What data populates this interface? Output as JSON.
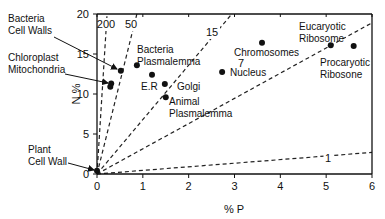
{
  "chart_data": {
    "type": "scatter",
    "title": "",
    "xlabel": "% P",
    "ylabel": "% N",
    "xlim": [
      0,
      6
    ],
    "ylim": [
      0,
      20
    ],
    "xticks": [
      "0",
      "1",
      "2",
      "3",
      "4",
      "5",
      "6"
    ],
    "yticks": [
      "0",
      "5",
      "10",
      "15",
      "20"
    ],
    "grid": false,
    "ratio_lines": [
      {
        "label": "200",
        "ratio": 200
      },
      {
        "label": "50",
        "ratio": 50
      },
      {
        "label": "15",
        "ratio": 15
      },
      {
        "label": "7",
        "ratio": 7
      },
      {
        "label": "1",
        "ratio": 1
      }
    ],
    "points": [
      {
        "name": "Chloroplast",
        "x": 0.31,
        "y": 11.3
      },
      {
        "name": "Mitochondria",
        "x": 0.29,
        "y": 10.9
      },
      {
        "name": "Bacteria Cell Walls",
        "x": 0.52,
        "y": 12.9
      },
      {
        "name": "Bacteria Plasmalemma",
        "x": 0.87,
        "y": 13.6
      },
      {
        "name": "E.R",
        "x": 1.2,
        "y": 12.4
      },
      {
        "name": "Golgi",
        "x": 1.48,
        "y": 11.25
      },
      {
        "name": "Animal Plasmalemma",
        "x": 1.5,
        "y": 9.6
      },
      {
        "name": "Nucleus",
        "x": 2.73,
        "y": 12.75
      },
      {
        "name": "Chromosomes",
        "x": 3.6,
        "y": 16.4
      },
      {
        "name": "Eucaryotic Ribosome",
        "x": 5.1,
        "y": 16.1
      },
      {
        "name": "Procaryotic Ribosone",
        "x": 5.6,
        "y": 16.0
      },
      {
        "name": "Plant Cell Wall",
        "x": 0.0,
        "y": 0.4
      }
    ],
    "annotations": [
      {
        "text": [
          "Bacteria",
          "Cell Walls"
        ],
        "target": "Bacteria Cell Walls",
        "arrow": true
      },
      {
        "text": [
          "Chloroplast",
          "Mitochondria"
        ],
        "target": "Chloroplast",
        "arrow": true
      },
      {
        "text": [
          "Bacteria",
          "Plasmalemma"
        ],
        "target": "Bacteria Plasmalemma",
        "arrow": false
      },
      {
        "text": [
          "E.R"
        ],
        "target": "E.R",
        "arrow": false
      },
      {
        "text": [
          "Golgi"
        ],
        "target": "Golgi",
        "arrow": false
      },
      {
        "text": [
          "Animal",
          "Plasmalemma"
        ],
        "target": "Animal Plasmalemma",
        "arrow": false
      },
      {
        "text": [
          "Nucleus"
        ],
        "target": "Nucleus",
        "arrow": false
      },
      {
        "text": [
          "Chromosomes"
        ],
        "target": "Chromosomes",
        "arrow": false
      },
      {
        "text": [
          "Eucaryotic",
          "Ribosome"
        ],
        "target": "Eucaryotic Ribosome",
        "arrow": false
      },
      {
        "text": [
          "Procaryotic",
          "Ribosone"
        ],
        "target": "Procaryotic Ribosone",
        "arrow": false
      },
      {
        "text": [
          "Plant",
          "Cell Wall"
        ],
        "target": "Plant Cell Wall",
        "arrow": true
      }
    ]
  }
}
